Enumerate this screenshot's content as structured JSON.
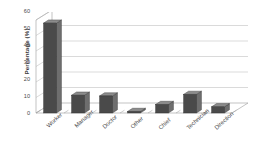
{
  "chart_data": {
    "type": "bar",
    "title": "",
    "subtitle": "",
    "xlabel": "",
    "ylabel": "Percentage (%)",
    "categories": [
      "Worker",
      "Manager",
      "Doctor",
      "Other",
      "Chief",
      "Technician",
      "Direction"
    ],
    "values": [
      58,
      11.5,
      11,
      1,
      5.5,
      12,
      4
    ],
    "series": [
      {
        "name": "Percentage",
        "values": [
          58,
          11.5,
          11,
          1,
          5.5,
          12,
          4
        ]
      }
    ],
    "ylim": [
      0,
      60
    ],
    "yticks": [
      0,
      10,
      20,
      30,
      40,
      50,
      60
    ],
    "ytick_labels": [
      "0",
      "10",
      "20",
      "30",
      "40",
      "50",
      "60"
    ],
    "grid": true,
    "grid_axis": "y",
    "legend": false,
    "legend_position": "none",
    "style": "3d-column",
    "bar_color": "#4a4a4a",
    "bar_side_color": "#6e6e6e",
    "bar_top_color": "#8c8c8c",
    "grid_color": "#b5b5b5",
    "axis_color": "#9a9a9a",
    "background_color": "#ffffff",
    "text_color": "#4a4a4a"
  }
}
